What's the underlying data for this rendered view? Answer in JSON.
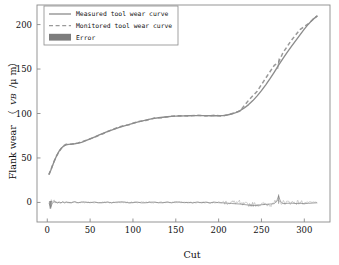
{
  "chart_data": {
    "type": "line",
    "title": "",
    "xlabel": "Cut",
    "ylabel_prefix": "Flank wear",
    "ylabel_paren_open": "（",
    "ylabel_symbol": "VB",
    "ylabel_unit": "/μ m）",
    "xlim": [
      -12,
      330
    ],
    "ylim": [
      -22,
      222
    ],
    "xticks": [
      0,
      50,
      100,
      150,
      200,
      250,
      300
    ],
    "yticks": [
      0,
      50,
      100,
      150,
      200
    ],
    "xtick_labels": [
      "0",
      "50",
      "100",
      "150",
      "200",
      "250",
      "300"
    ],
    "ytick_labels": [
      "0",
      "50",
      "100",
      "150",
      "200"
    ],
    "grid": false,
    "legend_position": "upper-left",
    "colors": {
      "measured": "#8c8c8c",
      "monitored": "#9a9a9a",
      "error": "#7d7d7d",
      "frame": "#8a8a8a",
      "background": "#ffffff",
      "text": "#111111"
    },
    "series": [
      {
        "name": "Measured tool wear curve",
        "style": "solid",
        "x": [
          2,
          4,
          6,
          8,
          10,
          12,
          14,
          16,
          18,
          20,
          22,
          25,
          28,
          32,
          36,
          40,
          45,
          50,
          55,
          60,
          65,
          70,
          75,
          80,
          85,
          90,
          95,
          100,
          105,
          110,
          115,
          120,
          125,
          130,
          135,
          140,
          145,
          150,
          155,
          160,
          165,
          170,
          175,
          180,
          185,
          190,
          195,
          200,
          205,
          210,
          215,
          220,
          225,
          230,
          235,
          240,
          245,
          250,
          255,
          260,
          265,
          270,
          275,
          280,
          285,
          290,
          295,
          300,
          305,
          310,
          315
        ],
        "y": [
          32,
          36,
          41,
          46,
          50.5,
          54.5,
          58,
          60.5,
          62.5,
          64,
          64.8,
          65.3,
          65.6,
          66,
          66.6,
          67.6,
          69.4,
          71.4,
          73.5,
          75.6,
          77.6,
          79.5,
          81.3,
          83,
          84.6,
          86.1,
          87.6,
          89,
          90.3,
          91.5,
          92.6,
          93.6,
          94.5,
          95.2,
          95.8,
          96.3,
          96.7,
          97,
          97.2,
          97.4,
          97.5,
          97.6,
          97.6,
          97.6,
          97.6,
          97.5,
          97.5,
          97.5,
          97.7,
          98.3,
          99.4,
          101,
          103.2,
          106.2,
          110,
          114.5,
          119.8,
          125.7,
          132.2,
          139.2,
          146.6,
          154.3,
          161.6,
          168.6,
          175.4,
          182,
          188.5,
          194.8,
          200.7,
          205.8,
          209.5
        ]
      },
      {
        "name": "Monitored tool wear curve",
        "style": "dashed",
        "x": [
          2,
          6,
          10,
          14,
          18,
          22,
          28,
          36,
          45,
          55,
          65,
          75,
          85,
          90,
          95,
          105,
          115,
          125,
          135,
          145,
          155,
          165,
          175,
          185,
          195,
          205,
          215,
          225,
          235,
          245,
          255,
          265,
          270,
          275,
          285,
          295,
          305,
          315
        ],
        "y": [
          31,
          41.5,
          51,
          57.5,
          63,
          65.4,
          65.4,
          66.8,
          69.8,
          73.2,
          77.3,
          81.6,
          85.2,
          86.6,
          87.2,
          90.7,
          92.2,
          94.9,
          95.4,
          96.9,
          97.6,
          97.1,
          98.1,
          97.2,
          97.9,
          97.1,
          99.8,
          102.8,
          114.9,
          125.1,
          139.8,
          154.2,
          157.5,
          168.2,
          182.4,
          194.4,
          201.2,
          209.9
        ]
      },
      {
        "name": "Error",
        "style": "filled",
        "x": [
          2,
          4,
          6,
          8,
          10,
          12,
          14,
          16,
          18,
          20,
          22,
          25,
          28,
          32,
          36,
          40,
          45,
          50,
          55,
          60,
          65,
          70,
          75,
          80,
          85,
          90,
          95,
          100,
          105,
          110,
          115,
          120,
          125,
          130,
          135,
          140,
          145,
          150,
          155,
          160,
          165,
          170,
          175,
          180,
          185,
          190,
          195,
          200,
          205,
          210,
          215,
          220,
          225,
          230,
          235,
          240,
          245,
          250,
          255,
          260,
          265,
          268,
          270,
          272,
          275,
          280,
          285,
          290,
          295,
          300,
          305,
          310,
          315
        ],
        "y": [
          -1,
          -5.5,
          -0.5,
          0.8,
          0.5,
          -0.6,
          0.4,
          -0.4,
          0.6,
          -0.5,
          0.6,
          -0.2,
          -0.3,
          0.8,
          -0.4,
          0.5,
          0.4,
          -0.3,
          0.5,
          -0.4,
          -0.3,
          0.5,
          -0.4,
          0.3,
          0.6,
          0.5,
          -0.4,
          -0.3,
          0.4,
          -0.5,
          -0.4,
          0.3,
          0.4,
          -0.3,
          -0.4,
          0.6,
          -0.5,
          0.6,
          0.4,
          -0.3,
          0.1,
          -0.5,
          0.5,
          -0.4,
          0.4,
          -0.5,
          0.4,
          -0.3,
          -0.5,
          -0.8,
          -1.2,
          -1.5,
          -1.8,
          -2.4,
          -3,
          -3.4,
          -3.2,
          -2.6,
          -2.2,
          -1.8,
          -1.4,
          2,
          7.5,
          1.5,
          -1.3,
          -1,
          -0.8,
          -1.2,
          -0.9,
          -1.4,
          -1,
          -0.7,
          -0.4
        ]
      }
    ]
  },
  "legend": {
    "items": [
      {
        "label": "Measured tool wear curve",
        "marker": "solid-line"
      },
      {
        "label": "Monitored tool wear curve",
        "marker": "dashed-line"
      },
      {
        "label": "Error",
        "marker": "filled-swatch"
      }
    ]
  }
}
